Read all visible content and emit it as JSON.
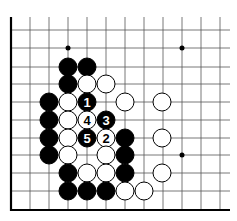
{
  "board": {
    "cols_x": [
      11,
      30,
      49,
      68,
      87,
      106,
      125,
      144,
      163,
      182,
      201,
      220
    ],
    "rows_y": [
      30,
      48,
      67,
      84,
      102,
      120,
      138,
      155,
      173,
      191,
      210
    ],
    "left_edge_x": 11,
    "bottom_edge_y": 210,
    "top_y": 17,
    "right_x": 230,
    "hoshi": [
      [
        68,
        48
      ],
      [
        182,
        48
      ],
      [
        182,
        155
      ]
    ]
  },
  "stones": [
    {
      "c": "B",
      "x": 68,
      "y": 67
    },
    {
      "c": "B",
      "x": 87,
      "y": 67
    },
    {
      "c": "B",
      "x": 68,
      "y": 84
    },
    {
      "c": "W",
      "x": 87,
      "y": 84
    },
    {
      "c": "W",
      "x": 106,
      "y": 84
    },
    {
      "c": "B",
      "x": 49,
      "y": 102
    },
    {
      "c": "W",
      "x": 68,
      "y": 102
    },
    {
      "c": "B",
      "x": 87,
      "y": 102,
      "n": "1"
    },
    {
      "c": "W",
      "x": 125,
      "y": 102
    },
    {
      "c": "W",
      "x": 162,
      "y": 102
    },
    {
      "c": "B",
      "x": 49,
      "y": 120
    },
    {
      "c": "W",
      "x": 68,
      "y": 120
    },
    {
      "c": "W",
      "x": 87,
      "y": 120,
      "n": "4"
    },
    {
      "c": "B",
      "x": 106,
      "y": 120,
      "n": "3"
    },
    {
      "c": "B",
      "x": 49,
      "y": 138
    },
    {
      "c": "W",
      "x": 68,
      "y": 138
    },
    {
      "c": "B",
      "x": 87,
      "y": 138,
      "n": "5"
    },
    {
      "c": "W",
      "x": 106,
      "y": 138,
      "n": "2"
    },
    {
      "c": "B",
      "x": 125,
      "y": 138
    },
    {
      "c": "W",
      "x": 162,
      "y": 138
    },
    {
      "c": "B",
      "x": 49,
      "y": 155
    },
    {
      "c": "W",
      "x": 68,
      "y": 155
    },
    {
      "c": "W",
      "x": 106,
      "y": 155
    },
    {
      "c": "B",
      "x": 125,
      "y": 155
    },
    {
      "c": "B",
      "x": 68,
      "y": 173
    },
    {
      "c": "W",
      "x": 87,
      "y": 173
    },
    {
      "c": "W",
      "x": 106,
      "y": 173
    },
    {
      "c": "B",
      "x": 125,
      "y": 173
    },
    {
      "c": "W",
      "x": 162,
      "y": 173
    },
    {
      "c": "B",
      "x": 68,
      "y": 191
    },
    {
      "c": "B",
      "x": 87,
      "y": 191
    },
    {
      "c": "B",
      "x": 106,
      "y": 191
    },
    {
      "c": "W",
      "x": 125,
      "y": 191
    },
    {
      "c": "W",
      "x": 144,
      "y": 191
    }
  ]
}
